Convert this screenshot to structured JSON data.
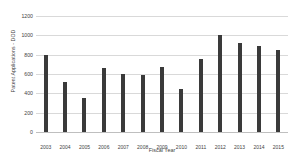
{
  "chart_data": {
    "type": "bar",
    "title": "",
    "xlabel": "Fiscal Year",
    "ylabel": "Patent Applications - DOD",
    "categories": [
      "2003",
      "2004",
      "2005",
      "2006",
      "2007",
      "2008",
      "2009",
      "2010",
      "2011",
      "2012",
      "2013",
      "2014",
      "2015"
    ],
    "values": [
      800,
      520,
      350,
      660,
      600,
      590,
      670,
      450,
      760,
      1000,
      920,
      890,
      850
    ],
    "ylim": [
      0,
      1200
    ],
    "ytick_labels": [
      "0",
      "200",
      "400",
      "600",
      "800",
      "1000",
      "1200"
    ],
    "ytick_values": [
      0,
      200,
      400,
      600,
      800,
      1000,
      1200
    ],
    "grid": true,
    "legend": false,
    "series": [
      {
        "name": "Patent Applications - DOD",
        "values": [
          800,
          520,
          350,
          660,
          600,
          590,
          670,
          450,
          760,
          1000,
          920,
          890,
          850
        ]
      }
    ],
    "colors": {
      "bar": "#3a3a3a",
      "grid": "#d9d9d9",
      "axis": "#bfbfbf",
      "text": "#3f3f3f",
      "background": "#ffffff"
    }
  }
}
